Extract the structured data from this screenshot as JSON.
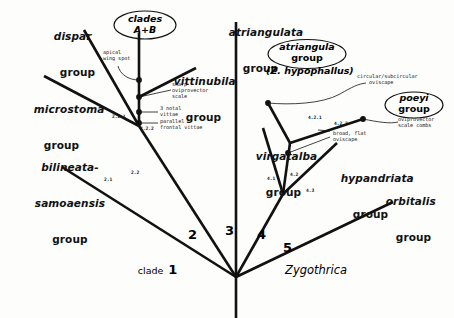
{
  "figure": {
    "genus_label": "Zygothrica",
    "type": "cladogram"
  },
  "terminal_groups": [
    {
      "id": "dispar",
      "line1": "dispar",
      "line2": "group"
    },
    {
      "id": "microstoma",
      "line1": "microstoma",
      "line2": "group"
    },
    {
      "id": "bilineata",
      "line1": "bilineata-",
      "line1b": "samoaensis",
      "line2": "group"
    },
    {
      "id": "vittinubila",
      "line1": "vittinubila",
      "line2": "group"
    },
    {
      "id": "atriangulata",
      "line1": "atriangulata",
      "line2": "group"
    },
    {
      "id": "virgatalba",
      "line1": "virgatalba",
      "line2": "group"
    },
    {
      "id": "hypandriata",
      "line1": "hypandriata",
      "line2": "group"
    },
    {
      "id": "orbitalis",
      "line1": "orbitalis",
      "line2": "group"
    }
  ],
  "ellipses": [
    {
      "id": "clades-ab",
      "line1": "clades",
      "line2": "A+B"
    },
    {
      "id": "atriangula",
      "line1": "atriangula",
      "line2": "group",
      "paren": "(Z. hypophallus)"
    },
    {
      "id": "poeyi",
      "line1": "poeyi",
      "line2": "group"
    }
  ],
  "character_notes": [
    {
      "id": "apical-wing-spot",
      "text": "apical\nwing spot"
    },
    {
      "id": "sharp-oviprovector-scale",
      "text": "sharp\noviprovector\nscale"
    },
    {
      "id": "three-notal-vittae",
      "text": "3 notal\nvittae"
    },
    {
      "id": "parallel-frontal-vittae",
      "text": "parallel\nfrontal vittae"
    },
    {
      "id": "circular-subcircular-oviscape",
      "text": "circular/subcircular\n    oviscape"
    },
    {
      "id": "oviprovector-scale-combs",
      "text": "oviprovector\nscale combs"
    },
    {
      "id": "broad-flat-oviscape",
      "text": "broad, flat\noviscape"
    }
  ],
  "node_numbers": [
    {
      "id": "n-2-1",
      "text": "2.1"
    },
    {
      "id": "n-2-2",
      "text": "2.2"
    },
    {
      "id": "n-2-2-1",
      "text": "2.2.1"
    },
    {
      "id": "n-2-2-2",
      "text": "2.2.2"
    },
    {
      "id": "n-4-1",
      "text": "4.1"
    },
    {
      "id": "n-4-2",
      "text": "4.2"
    },
    {
      "id": "n-4-3",
      "text": "4.3"
    },
    {
      "id": "n-4-2-1",
      "text": "4.2.1"
    },
    {
      "id": "n-4-2-2",
      "text": "4.2.2"
    }
  ],
  "clade_numbers": [
    {
      "id": "clade-1",
      "word": "clade",
      "num": "1"
    },
    {
      "id": "clade-2",
      "num": "2"
    },
    {
      "id": "clade-3",
      "num": "3"
    },
    {
      "id": "clade-4",
      "num": "4"
    },
    {
      "id": "clade-5",
      "num": "5"
    }
  ],
  "colors": {
    "ink": "#111111",
    "background": "#fdfdfc"
  }
}
